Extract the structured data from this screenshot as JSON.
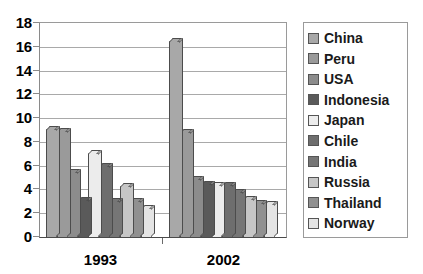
{
  "chart_data": {
    "type": "bar",
    "title": "",
    "subtitle": "",
    "xlabel": "",
    "ylabel": "",
    "categories": [
      "1993",
      "2002"
    ],
    "ylim": [
      0,
      18
    ],
    "ytick_step": 2,
    "yticks": [
      "18",
      "16",
      "14",
      "12",
      "10",
      "8",
      "6",
      "4",
      "2",
      "0"
    ],
    "grid": true,
    "legend_position": "right",
    "series": [
      {
        "name": "China",
        "color": "#a8a8a8",
        "values": [
          9.1,
          16.5
        ]
      },
      {
        "name": "Peru",
        "color": "#9a9a9a",
        "values": [
          8.9,
          8.8
        ]
      },
      {
        "name": "USA",
        "color": "#8c8c8c",
        "values": [
          5.5,
          4.9
        ]
      },
      {
        "name": "Indonesia",
        "color": "#5a5a5a",
        "values": [
          3.1,
          4.5
        ]
      },
      {
        "name": "Japan",
        "color": "#ececec",
        "values": [
          7.1,
          4.4
        ]
      },
      {
        "name": "Chile",
        "color": "#6e6e6e",
        "values": [
          6.0,
          4.4
        ]
      },
      {
        "name": "India",
        "color": "#767676",
        "values": [
          3.0,
          3.8
        ]
      },
      {
        "name": "Russia",
        "color": "#c6c6c6",
        "values": [
          4.3,
          3.2
        ]
      },
      {
        "name": "Thailand",
        "color": "#909090",
        "values": [
          3.0,
          2.9
        ]
      },
      {
        "name": "Norway",
        "color": "#e4e4e4",
        "values": [
          2.4,
          2.8
        ]
      }
    ]
  }
}
